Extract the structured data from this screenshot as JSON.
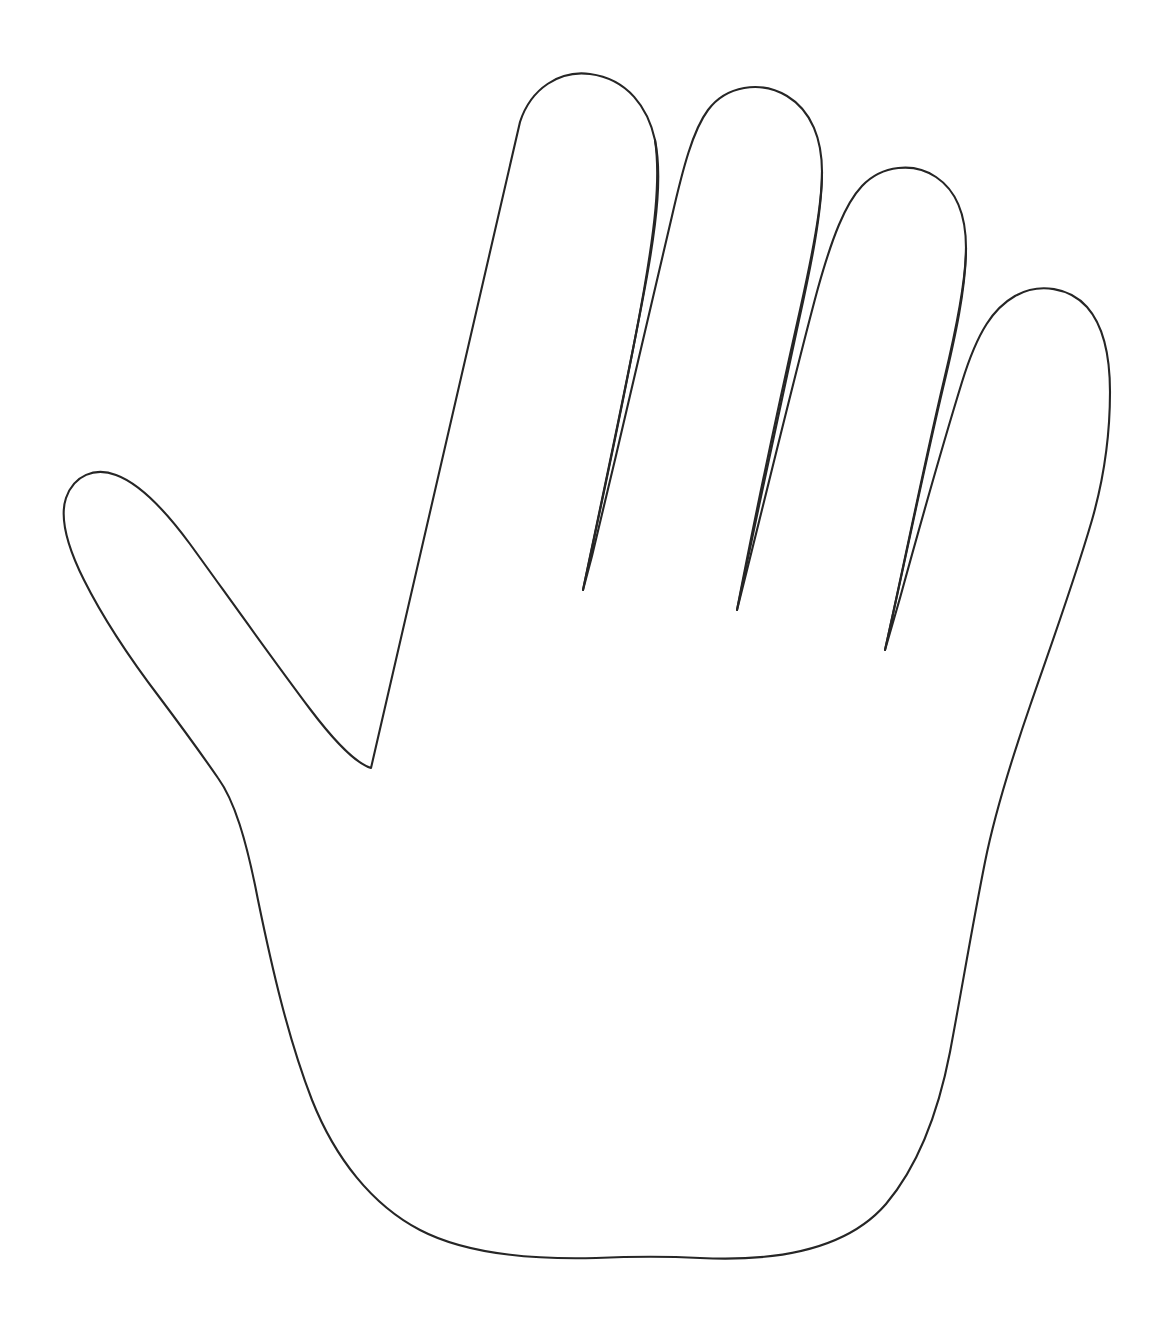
{
  "page": {
    "background_color": "#ffffff",
    "width": 1168,
    "height": 1330
  },
  "drawing": {
    "name": "hand-outline",
    "description": "Line-art outline of an open right hand, palm facing viewer, fingers spread, drawn as a single continuous black contour on a plain white background.",
    "stroke_color": "#262626",
    "fill_color": "none",
    "stroke_width": 2.1,
    "style": "single-weight continuous contour line drawing",
    "orientation": "fingers pointing up, wrist at bottom",
    "hand_side": "right hand, palm view",
    "parts": [
      {
        "name": "thumb",
        "label": "Thumb",
        "tip_x": 105,
        "tip_y": 478,
        "leftmost_x": 63,
        "leftmost_y": 545
      },
      {
        "name": "index-finger",
        "label": "Index finger",
        "tip_x": 602,
        "tip_y": 78
      },
      {
        "name": "middle-finger",
        "label": "Middle finger",
        "tip_x": 768,
        "tip_y": 92
      },
      {
        "name": "ring-finger",
        "label": "Ring finger",
        "tip_x": 925,
        "tip_y": 172
      },
      {
        "name": "little-finger",
        "label": "Little finger",
        "tip_x": 1060,
        "tip_y": 288
      },
      {
        "name": "palm",
        "label": "Palm",
        "tip_x": 600,
        "tip_y": 1000
      },
      {
        "name": "wrist",
        "label": "Wrist",
        "tip_x": 600,
        "tip_y": 1258
      }
    ],
    "web_notches": [
      {
        "name": "thumb-index-notch",
        "x": 371,
        "y": 768
      },
      {
        "name": "index-middle-notch",
        "x": 583,
        "y": 590
      },
      {
        "name": "middle-ring-notch",
        "x": 737,
        "y": 610
      },
      {
        "name": "ring-little-notch",
        "x": 885,
        "y": 650
      }
    ],
    "paths": {
      "outline": "M 371 768 L 520 122 C 531 88 560 70 590 74 C 628 79 648 108 655 140 C 662 174 657 220 647 276 C 632 360 608 470 583 590 L 592 556 C 620 440 650 310 672 216 C 683 168 693 130 708 110 C 726 86 760 80 787 96 C 812 111 822 140 822 172 C 822 206 812 256 800 310 C 782 390 758 500 737 610 L 748 566 C 772 470 800 354 818 288 C 832 238 845 204 862 186 C 882 165 914 162 936 177 C 957 191 966 217 966 248 C 966 282 956 330 944 380 C 925 460 905 560 885 650 L 900 598 C 922 518 946 434 962 382 C 978 330 994 308 1015 296 C 1040 282 1070 288 1087 307 C 1102 324 1110 352 1110 392 C 1110 432 1104 478 1092 520 C 1074 582 1050 648 1030 706 C 1010 764 995 812 985 862 C 973 922 962 988 950 1052 C 938 1114 918 1166 886 1204 C 848 1248 782 1262 700 1258 C 660 1256 620 1257 596 1258 C 520 1260 462 1252 420 1230 C 372 1205 335 1158 312 1100 C 288 1038 272 968 258 900 C 246 838 234 800 218 778 C 200 752 184 730 160 698 C 128 656 102 616 84 580 C 66 544 60 516 66 498 C 74 475 95 467 116 475 C 138 483 162 506 190 544 C 222 588 268 653 310 709 C 338 746 358 764 371 768 Z",
      "crease_index_middle": "M 655 140 C 661 180 654 232 644 290 C 628 382 604 492 583 590",
      "crease_middle_ring": "M 822 172 C 822 212 811 266 799 320 C 781 404 757 514 737 610",
      "crease_ring_little": "M 966 248 C 966 288 955 338 943 388 C 924 468 904 566 885 650"
    }
  }
}
